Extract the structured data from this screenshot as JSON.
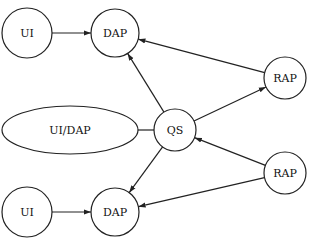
{
  "diagram": {
    "nodes": [
      {
        "id": "ui_top",
        "label": "UI",
        "shape": "circle",
        "cx": 27,
        "cy": 33,
        "r": 25
      },
      {
        "id": "dap_top",
        "label": "DAP",
        "shape": "circle",
        "cx": 115,
        "cy": 33,
        "r": 24
      },
      {
        "id": "rap_top",
        "label": "RAP",
        "shape": "circle",
        "cx": 285,
        "cy": 78,
        "r": 21
      },
      {
        "id": "uidap",
        "label": "UI/DAP",
        "shape": "ellipse",
        "cx": 70,
        "cy": 130,
        "rx": 68,
        "ry": 24
      },
      {
        "id": "qs",
        "label": "QS",
        "shape": "circle",
        "cx": 175,
        "cy": 130,
        "r": 21
      },
      {
        "id": "rap_bottom",
        "label": "RAP",
        "shape": "circle",
        "cx": 285,
        "cy": 173,
        "r": 21
      },
      {
        "id": "ui_bottom",
        "label": "UI",
        "shape": "circle",
        "cx": 27,
        "cy": 212,
        "r": 25
      },
      {
        "id": "dap_bottom",
        "label": "DAP",
        "shape": "circle",
        "cx": 115,
        "cy": 212,
        "r": 24
      }
    ],
    "edges": [
      {
        "from": "ui_top",
        "to": "dap_top",
        "arrow": true
      },
      {
        "from": "rap_top",
        "to": "dap_top",
        "arrow": true
      },
      {
        "from": "qs",
        "to": "dap_top",
        "arrow": true
      },
      {
        "from": "qs",
        "to": "rap_top",
        "arrow": true
      },
      {
        "from": "uidap",
        "to": "qs",
        "arrow": false
      },
      {
        "from": "rap_bottom",
        "to": "qs",
        "arrow": true
      },
      {
        "from": "qs",
        "to": "dap_bottom",
        "arrow": true
      },
      {
        "from": "rap_bottom",
        "to": "dap_bottom",
        "arrow": true
      },
      {
        "from": "ui_bottom",
        "to": "dap_bottom",
        "arrow": true
      }
    ]
  }
}
